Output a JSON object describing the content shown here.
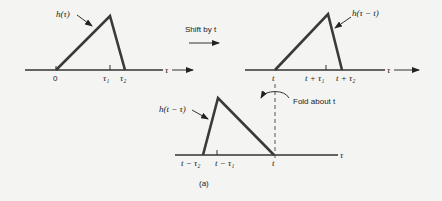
{
  "panel1": {
    "curve_label": "h(τ)",
    "ticks": [
      "0",
      "τ₁",
      "τ₂"
    ],
    "axis_label": "τ"
  },
  "shift": {
    "label": "Shift by t"
  },
  "panel2": {
    "curve_label": "h(τ − t)",
    "ticks": [
      "t",
      "t + τ₁",
      "t + τ₂"
    ],
    "axis_label": "τ"
  },
  "fold": {
    "label": "Fold about t"
  },
  "panel3": {
    "curve_label": "h(t − τ)",
    "ticks": [
      "t − τ₂",
      "t − τ₁",
      "t"
    ],
    "axis_label": "τ"
  },
  "caption": "(a)"
}
